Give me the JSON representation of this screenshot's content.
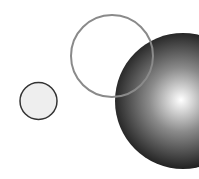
{
  "canvas": {
    "width": 199,
    "height": 179,
    "background": "#ffffff"
  },
  "shapes": {
    "small_circle": {
      "cx": 38.5,
      "cy": 101,
      "r": 18.5,
      "fill": "#eeeeee",
      "stroke": "#333333",
      "stroke_width": 1.5
    },
    "shaded_sphere": {
      "cx": 183,
      "cy": 101,
      "r": 68,
      "highlight_color": "#ffffff",
      "mid_color": "#8a8a8a",
      "edge_color": "#1a1a1a",
      "highlight_cx": 181,
      "highlight_cy": 100
    },
    "outline_circle": {
      "cx": 112,
      "cy": 56,
      "r": 41,
      "fill": "none",
      "stroke": "#8a8a8a",
      "stroke_width": 2
    }
  }
}
